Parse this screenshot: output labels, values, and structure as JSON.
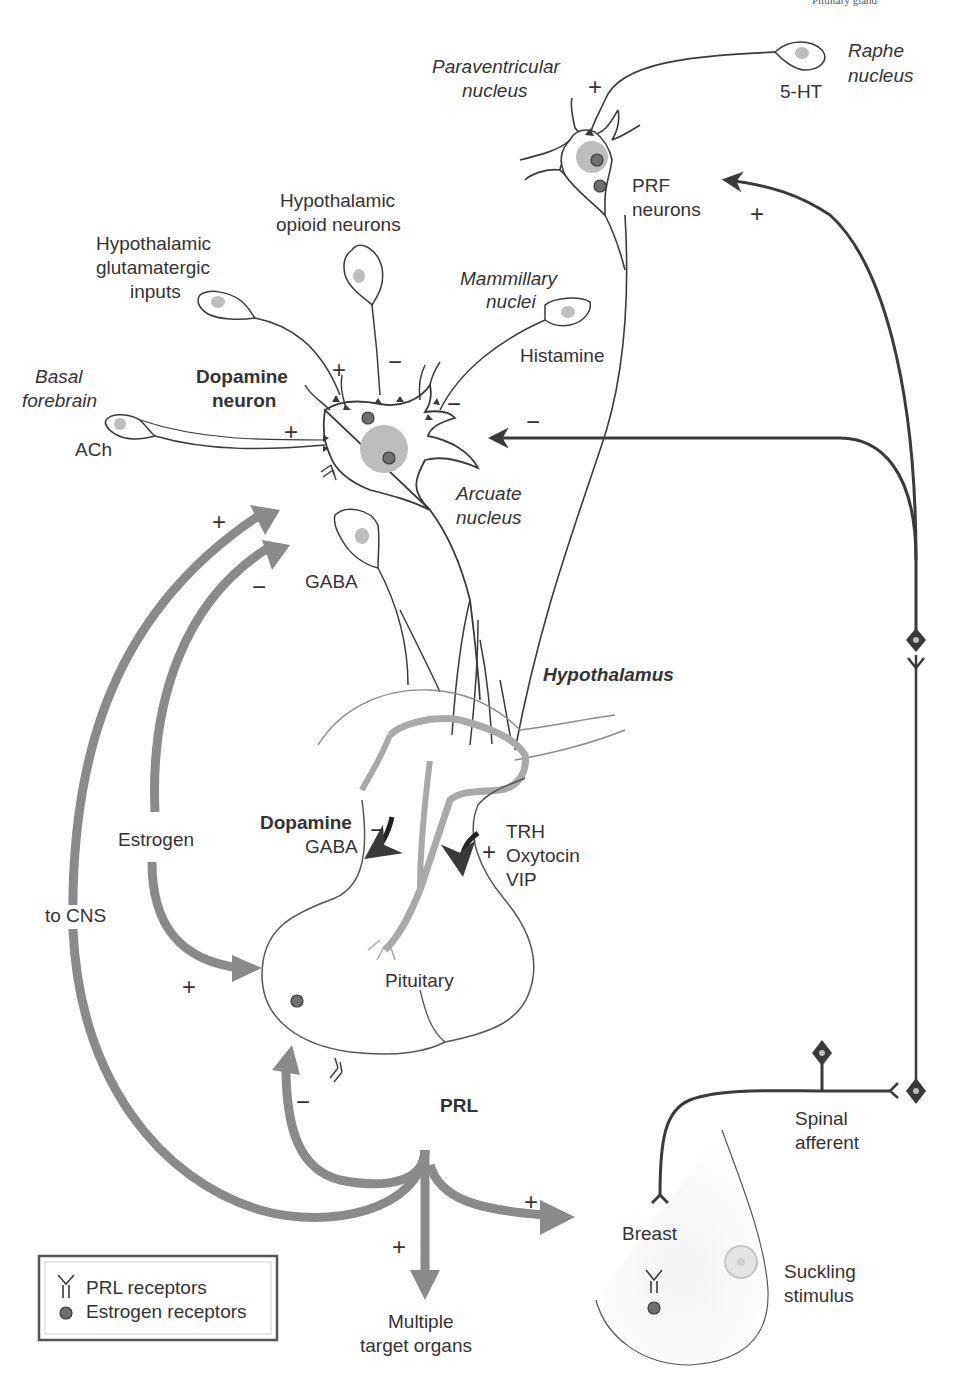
{
  "header_fragment": "Pituitary gland",
  "labels": {
    "raphe": [
      "Raphe",
      "nucleus"
    ],
    "serotonin": "5-HT",
    "paraventricular": [
      "Paraventricular",
      "nucleus"
    ],
    "prf": [
      "PRF",
      "neurons"
    ],
    "opioid": [
      "Hypothalamic",
      "opioid neurons"
    ],
    "glutamatergic": [
      "Hypothalamic",
      "glutamatergic",
      "inputs"
    ],
    "mammillary": [
      "Mammillary",
      "nuclei"
    ],
    "histamine": "Histamine",
    "basal": [
      "Basal",
      "forebrain"
    ],
    "ach": "ACh",
    "dopamine_neuron": [
      "Dopamine",
      "neuron"
    ],
    "arcuate": [
      "Arcuate",
      "nucleus"
    ],
    "gaba_neuron": "GABA",
    "hypothalamus": "Hypothalamus",
    "estrogen": "Estrogen",
    "to_cns": "to CNS",
    "dopamine_release": [
      "Dopamine",
      "GABA"
    ],
    "stimulators": [
      "TRH",
      "Oxytocin",
      "VIP"
    ],
    "pituitary": "Pituitary",
    "prl": "PRL",
    "spinal": [
      "Spinal",
      "afferent"
    ],
    "breast": "Breast",
    "suckling": [
      "Suckling",
      "stimulus"
    ],
    "targets": [
      "Multiple",
      "target organs"
    ]
  },
  "signs": {
    "plus": "+",
    "minus": "−"
  },
  "legend": {
    "items": [
      {
        "icon": "prl-receptor-icon",
        "label": "PRL receptors"
      },
      {
        "icon": "estrogen-receptor-icon",
        "label": "Estrogen receptors"
      }
    ]
  },
  "colors": {
    "line": "#3a3a3a",
    "arrow_fill": "#8a8a8a",
    "nucleus_fill": "#bdbdbd",
    "receptor_dot": "#6f6f6f",
    "portal": "#a9a9a9"
  }
}
